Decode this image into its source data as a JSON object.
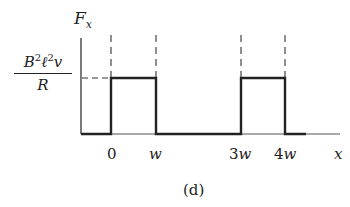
{
  "figure": {
    "caption": "(d)",
    "y_axis_label": "F",
    "y_axis_label_subscript": "x",
    "x_axis_label": "x",
    "level_label": {
      "numerator_parts": [
        "B",
        "2",
        "ℓ",
        "2",
        "v"
      ],
      "denominator": "R"
    },
    "tick_labels": [
      "0",
      "w",
      "3w",
      "4w"
    ]
  },
  "chart_data": {
    "type": "line",
    "title": "",
    "xlabel": "x",
    "ylabel": "F_x",
    "x_tick_labels": [
      "0",
      "w",
      "3w",
      "4w"
    ],
    "series": [
      {
        "name": "F_x",
        "description": "Rectangular pulses of height B²ℓ²v/R for 0 ≤ x ≤ w and 3w ≤ x ≤ 4w, zero elsewhere",
        "points": [
          {
            "x": "start",
            "y": 0
          },
          {
            "x": "0",
            "y": 0
          },
          {
            "x": "0",
            "y": "B²ℓ²v/R"
          },
          {
            "x": "w",
            "y": "B²ℓ²v/R"
          },
          {
            "x": "w",
            "y": 0
          },
          {
            "x": "3w",
            "y": 0
          },
          {
            "x": "3w",
            "y": "B²ℓ²v/R"
          },
          {
            "x": "4w",
            "y": "B²ℓ²v/R"
          },
          {
            "x": "4w",
            "y": 0
          },
          {
            "x": "end",
            "y": 0
          }
        ]
      }
    ],
    "reference_lines": {
      "horizontal_dashed": "y = B²ℓ²v/R from axis to x = 0",
      "vertical_dashed": [
        "0",
        "w",
        "3w",
        "4w"
      ]
    },
    "grid": false,
    "legend": false
  }
}
